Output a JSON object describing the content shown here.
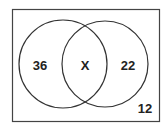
{
  "venn": {
    "left_only": "36",
    "intersection": "X",
    "right_only": "22",
    "outside": "12"
  },
  "colors": {
    "stroke": "#333333",
    "text": "#222222"
  }
}
